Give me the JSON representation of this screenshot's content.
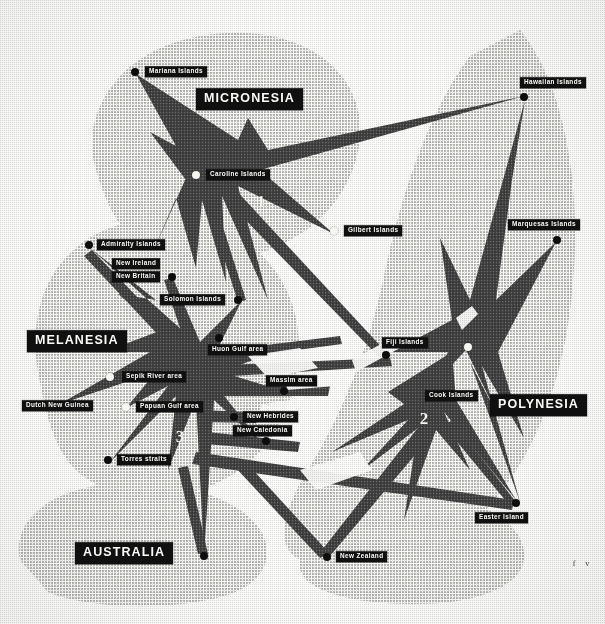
{
  "map": {
    "title": "Culture areas of Oceania",
    "colors": {
      "paper": "#fcfcfa",
      "ink_dark": "#4a4a4a",
      "ink_light": "#d8d8d4",
      "label_bg": "#101010",
      "label_fg": "#fbfbf7"
    },
    "region_labels": [
      {
        "name": "micronesia",
        "text": "MICRONESIA",
        "x": 196,
        "y": 99
      },
      {
        "name": "melanesia",
        "text": "MELANESIA",
        "x": 27,
        "y": 341
      },
      {
        "name": "polynesia",
        "text": "POLYNESIA",
        "x": 490,
        "y": 405
      },
      {
        "name": "australia",
        "text": "AUSTRALIA",
        "x": 75,
        "y": 553
      }
    ],
    "area_numbers": [
      {
        "name": "area-number-1",
        "text": "1",
        "x": 261,
        "y": 202
      },
      {
        "name": "area-number-2",
        "text": "2",
        "x": 424,
        "y": 419
      },
      {
        "name": "area-number-3",
        "text": "3",
        "x": 180,
        "y": 437
      }
    ],
    "places": [
      {
        "name": "mariana-islands",
        "text": "Mariana Islands",
        "dot": "dark",
        "dot_x": 135,
        "dot_y": 72,
        "label_x": 145,
        "label_y": 72
      },
      {
        "name": "hawaiian-islands",
        "text": "Hawaiian Islands",
        "dot": "dark",
        "dot_x": 524,
        "dot_y": 97,
        "label_x": 520,
        "label_y": 83
      },
      {
        "name": "caroline-islands",
        "text": "Caroline Islands",
        "dot": "light",
        "dot_x": 196,
        "dot_y": 175,
        "label_x": 206,
        "label_y": 175
      },
      {
        "name": "gilbert-islands",
        "text": "Gilbert Islands",
        "dot": "light",
        "dot_x": 334,
        "dot_y": 231,
        "label_x": 344,
        "label_y": 231
      },
      {
        "name": "marquesas-islands",
        "text": "Marquesas Islands",
        "dot": "dark",
        "dot_x": 557,
        "dot_y": 240,
        "label_x": 508,
        "label_y": 225
      },
      {
        "name": "admiralty-islands",
        "text": "Admiralty Islands",
        "dot": "dark",
        "dot_x": 89,
        "dot_y": 245,
        "label_x": 97,
        "label_y": 245
      },
      {
        "name": "new-ireland",
        "text": "New Ireland",
        "dot": "none",
        "dot_x": 0,
        "dot_y": 0,
        "label_x": 112,
        "label_y": 264
      },
      {
        "name": "new-britain",
        "text": "New Britain",
        "dot": "dark",
        "dot_x": 172,
        "dot_y": 277,
        "label_x": 112,
        "label_y": 277
      },
      {
        "name": "solomon-islands",
        "text": "Solomon Islands",
        "dot": "dark",
        "dot_x": 238,
        "dot_y": 300,
        "label_x": 160,
        "label_y": 300
      },
      {
        "name": "huon-gulf-area",
        "text": "Huon Gulf area",
        "dot": "dark",
        "dot_x": 219,
        "dot_y": 338,
        "label_x": 208,
        "label_y": 350
      },
      {
        "name": "fiji-islands",
        "text": "Fiji Islands",
        "dot": "dark",
        "dot_x": 386,
        "dot_y": 355,
        "label_x": 382,
        "label_y": 343
      },
      {
        "name": "sepik-river-area",
        "text": "Sepik River area",
        "dot": "light",
        "dot_x": 110,
        "dot_y": 377,
        "label_x": 122,
        "label_y": 377
      },
      {
        "name": "massim-area",
        "text": "Massim area",
        "dot": "dark",
        "dot_x": 284,
        "dot_y": 391,
        "label_x": 266,
        "label_y": 381
      },
      {
        "name": "cook-islands",
        "text": "Cook Islands",
        "dot": "light",
        "dot_x": 468,
        "dot_y": 347,
        "label_x": 425,
        "label_y": 396
      },
      {
        "name": "dutch-new-guinea",
        "text": "Dutch New Guinea",
        "dot": "dark",
        "dot_x": 58,
        "dot_y": 405,
        "label_x": 22,
        "label_y": 406
      },
      {
        "name": "papuan-gulf-area",
        "text": "Papuan Gulf area",
        "dot": "light",
        "dot_x": 126,
        "dot_y": 407,
        "label_x": 136,
        "label_y": 407
      },
      {
        "name": "new-hebrides",
        "text": "New Hebrides",
        "dot": "dark",
        "dot_x": 234,
        "dot_y": 417,
        "label_x": 243,
        "label_y": 417
      },
      {
        "name": "new-caledonia",
        "text": "New Caledonia",
        "dot": "dark",
        "dot_x": 266,
        "dot_y": 441,
        "label_x": 233,
        "label_y": 431
      },
      {
        "name": "torres-straits",
        "text": "Torres straits",
        "dot": "dark",
        "dot_x": 108,
        "dot_y": 460,
        "label_x": 117,
        "label_y": 460
      },
      {
        "name": "easter-island",
        "text": "Easter  Island",
        "dot": "dark",
        "dot_x": 516,
        "dot_y": 503,
        "label_x": 475,
        "label_y": 518
      },
      {
        "name": "new-zealand",
        "text": "New Zealand",
        "dot": "dark",
        "dot_x": 327,
        "dot_y": 557,
        "label_x": 336,
        "label_y": 557
      },
      {
        "name": "australia-dot",
        "text": "",
        "dot": "dark",
        "dot_x": 204,
        "dot_y": 556,
        "label_x": 0,
        "label_y": 0
      }
    ],
    "corner_mark": {
      "text": "f v",
      "x": 583,
      "y": 563
    }
  }
}
